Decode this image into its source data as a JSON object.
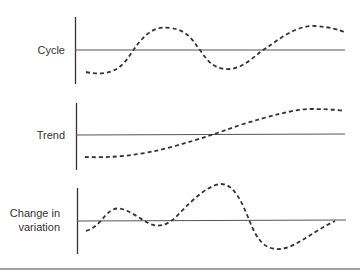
{
  "diagram": {
    "panels": [
      {
        "label": "Cycle",
        "pattern": "periodic oscillation around baseline"
      },
      {
        "label": "Trend",
        "pattern": "gradual rise crossing baseline"
      },
      {
        "label": "Change in variation",
        "label_lines": [
          "Change in",
          "variation"
        ],
        "pattern": "oscillation with increasing amplitude"
      }
    ],
    "colors": {
      "line": "#333333",
      "curve": "#333333",
      "background": "#ffffff"
    }
  }
}
